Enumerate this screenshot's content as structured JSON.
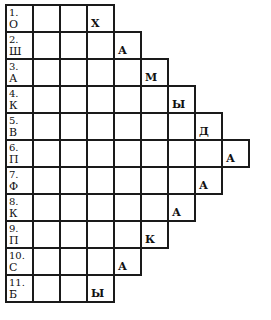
{
  "crossword": {
    "rows": [
      {
        "number": "1.",
        "first": "О",
        "length": 4,
        "last": "Х"
      },
      {
        "number": "2.",
        "first": "Ш",
        "length": 5,
        "last": "А"
      },
      {
        "number": "3.",
        "first": "А",
        "length": 6,
        "last": "М"
      },
      {
        "number": "4.",
        "first": "К",
        "length": 7,
        "last": "Ы"
      },
      {
        "number": "5.",
        "first": "В",
        "length": 8,
        "last": "Д"
      },
      {
        "number": "6.",
        "first": "П",
        "length": 9,
        "last": "А"
      },
      {
        "number": "7.",
        "first": "Ф",
        "length": 8,
        "last": "А"
      },
      {
        "number": "8.",
        "first": "К",
        "length": 7,
        "last": "А"
      },
      {
        "number": "9.",
        "first": "П",
        "length": 6,
        "last": "К"
      },
      {
        "number": "10.",
        "first": "С",
        "length": 5,
        "last": "А"
      },
      {
        "number": "11.",
        "first": "Б",
        "length": 4,
        "last": "Ы"
      }
    ]
  }
}
